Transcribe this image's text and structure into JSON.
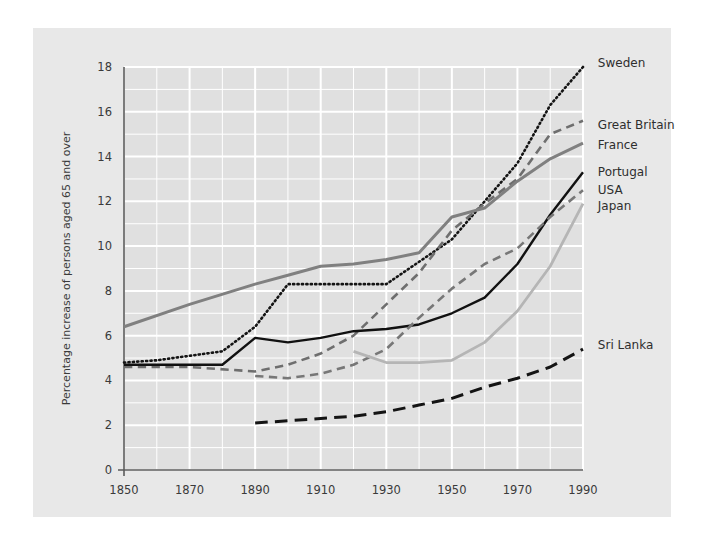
{
  "figure": {
    "background_color": "#e8e8e8",
    "page_background_color": "#ffffff",
    "plot_background_color": "#e0e0e0",
    "gridline_color": "#ffffff",
    "axis_color": "#5a5a5a"
  },
  "chart_data": {
    "type": "line",
    "title": "",
    "xlabel": "",
    "ylabel": "Percentage increase of persons aged 65 and over",
    "xlim": [
      1850,
      1990
    ],
    "ylim": [
      0,
      18
    ],
    "xticks": [
      1850,
      1870,
      1890,
      1910,
      1930,
      1950,
      1970,
      1990
    ],
    "xtick_labels": [
      "1850",
      "1870",
      "1890",
      "1910",
      "1930",
      "1950",
      "1970",
      "1990"
    ],
    "yticks": [
      0,
      2,
      4,
      6,
      8,
      10,
      12,
      14,
      16,
      18
    ],
    "ytick_labels": [
      "0",
      "2",
      "4",
      "6",
      "8",
      "10",
      "12",
      "14",
      "16",
      "18"
    ],
    "y_minor_tick_step": 1,
    "grid": true,
    "grid_color": "#ffffff",
    "legend_position": "right-of-plot-at-line-ends",
    "series": [
      {
        "name": "Sweden",
        "color": "#141414",
        "style": "dotted",
        "width": 2.6,
        "label_x": 1993,
        "label_y": 18.2,
        "x": [
          1850,
          1860,
          1870,
          1880,
          1890,
          1900,
          1910,
          1920,
          1930,
          1940,
          1950,
          1960,
          1970,
          1980,
          1990
        ],
        "y": [
          4.8,
          4.9,
          5.1,
          5.3,
          6.4,
          8.3,
          8.3,
          8.3,
          8.3,
          9.3,
          10.3,
          12.0,
          13.7,
          16.3,
          18.0
        ]
      },
      {
        "name": "Great Britain",
        "color": "#6e6e6e",
        "style": "dashed",
        "width": 2.6,
        "label_x": 1993,
        "label_y": 15.4,
        "x": [
          1850,
          1870,
          1890,
          1900,
          1910,
          1920,
          1930,
          1940,
          1950,
          1960,
          1970,
          1980,
          1990
        ],
        "y": [
          4.6,
          4.6,
          4.4,
          4.7,
          5.2,
          6.0,
          7.4,
          8.8,
          10.7,
          11.9,
          13.0,
          15.0,
          15.6
        ]
      },
      {
        "name": "France",
        "color": "#808080",
        "style": "solid",
        "width": 3.0,
        "label_x": 1993,
        "label_y": 14.5,
        "x": [
          1850,
          1870,
          1890,
          1900,
          1910,
          1920,
          1930,
          1940,
          1950,
          1960,
          1970,
          1980,
          1990
        ],
        "y": [
          6.4,
          7.4,
          8.3,
          8.7,
          9.1,
          9.2,
          9.4,
          9.7,
          11.3,
          11.7,
          12.9,
          13.9,
          14.6
        ]
      },
      {
        "name": "Portugal",
        "color": "#111111",
        "style": "solid",
        "width": 2.4,
        "label_x": 1993,
        "label_y": 13.3,
        "x": [
          1850,
          1870,
          1880,
          1890,
          1900,
          1910,
          1920,
          1930,
          1940,
          1950,
          1960,
          1970,
          1980,
          1990
        ],
        "y": [
          4.7,
          4.7,
          4.7,
          5.9,
          5.7,
          5.9,
          6.2,
          6.3,
          6.5,
          7.0,
          7.7,
          9.2,
          11.4,
          13.3
        ]
      },
      {
        "name": "USA",
        "color": "#777777",
        "style": "dashed",
        "width": 2.6,
        "label_x": 1993,
        "label_y": 12.5,
        "x": [
          1890,
          1900,
          1910,
          1920,
          1930,
          1940,
          1950,
          1960,
          1970,
          1980,
          1990
        ],
        "y": [
          4.2,
          4.1,
          4.3,
          4.7,
          5.4,
          6.8,
          8.1,
          9.2,
          9.9,
          11.3,
          12.5
        ]
      },
      {
        "name": "Japan",
        "color": "#b5b5b5",
        "style": "solid",
        "width": 2.8,
        "label_x": 1993,
        "label_y": 11.8,
        "x": [
          1920,
          1930,
          1940,
          1950,
          1960,
          1970,
          1980,
          1990
        ],
        "y": [
          5.3,
          4.8,
          4.8,
          4.9,
          5.7,
          7.1,
          9.1,
          11.9
        ]
      },
      {
        "name": "Sri Lanka",
        "color": "#141414",
        "style": "long-dashed",
        "width": 3.0,
        "label_x": 1993,
        "label_y": 5.6,
        "x": [
          1890,
          1900,
          1910,
          1920,
          1930,
          1940,
          1950,
          1960,
          1970,
          1980,
          1990
        ],
        "y": [
          2.1,
          2.2,
          2.3,
          2.4,
          2.6,
          2.9,
          3.2,
          3.7,
          4.1,
          4.6,
          5.4
        ]
      }
    ]
  }
}
